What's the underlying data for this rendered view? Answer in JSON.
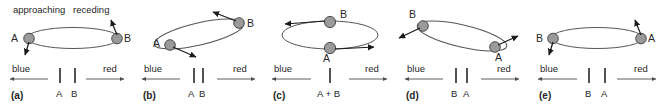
{
  "figure": {
    "colors": {
      "star_fill": "#9a9a9a",
      "star_stroke": "#4a4a4a",
      "orbit_stroke": "#555555",
      "arrow": "#1a1a1a",
      "axis": "#4d4d4d",
      "text": "#262626",
      "background": "#ffffff"
    }
  },
  "panels": [
    {
      "id": "a",
      "panel_label": "(a)",
      "notes": [
        {
          "name": "approaching-note",
          "text": "approaching"
        },
        {
          "name": "receding-note",
          "text": "receding"
        }
      ],
      "stars": [
        {
          "name": "star-a",
          "label": "A"
        },
        {
          "name": "star-b",
          "label": "B"
        }
      ],
      "spectrum": {
        "blue_label": "blue",
        "red_label": "red",
        "lines": [
          {
            "tick": "A"
          },
          {
            "tick": "B"
          }
        ]
      }
    },
    {
      "id": "b",
      "panel_label": "(b)",
      "notes": [],
      "stars": [
        {
          "name": "star-a",
          "label": "A"
        },
        {
          "name": "star-b",
          "label": "B"
        }
      ],
      "spectrum": {
        "blue_label": "blue",
        "red_label": "red",
        "lines": [
          {
            "tick": "A"
          },
          {
            "tick": "B"
          }
        ]
      }
    },
    {
      "id": "c",
      "panel_label": "(c)",
      "notes": [],
      "stars": [
        {
          "name": "star-b",
          "label": "B"
        },
        {
          "name": "star-a",
          "label": "A"
        }
      ],
      "spectrum": {
        "blue_label": "blue",
        "red_label": "red",
        "lines": [
          {
            "tick": "A + B"
          }
        ]
      }
    },
    {
      "id": "d",
      "panel_label": "(d)",
      "notes": [],
      "stars": [
        {
          "name": "star-b",
          "label": "B"
        },
        {
          "name": "star-a",
          "label": "A"
        }
      ],
      "spectrum": {
        "blue_label": "blue",
        "red_label": "red",
        "lines": [
          {
            "tick": "B"
          },
          {
            "tick": "A"
          }
        ]
      }
    },
    {
      "id": "e",
      "panel_label": "(e)",
      "notes": [],
      "stars": [
        {
          "name": "star-b",
          "label": "B"
        },
        {
          "name": "star-a",
          "label": "A"
        }
      ],
      "spectrum": {
        "blue_label": "blue",
        "red_label": "red",
        "lines": [
          {
            "tick": "B"
          },
          {
            "tick": "A"
          }
        ]
      }
    }
  ]
}
